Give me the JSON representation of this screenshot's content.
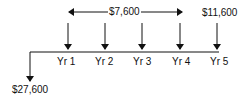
{
  "diagram": {
    "type": "cash-flow-timeline",
    "recurring_amount": "$7,600",
    "final_amount": "$11,600",
    "initial_amount": "$27,600",
    "years": [
      {
        "label": "Yr 1",
        "x": 68
      },
      {
        "label": "Yr 2",
        "x": 105
      },
      {
        "label": "Yr 3",
        "x": 142
      },
      {
        "label": "Yr 4",
        "x": 180
      },
      {
        "label": "Yr 5",
        "x": 217
      }
    ]
  }
}
